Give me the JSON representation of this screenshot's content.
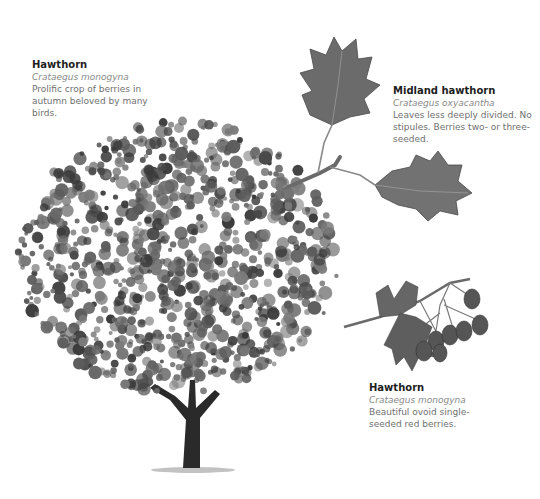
{
  "captions": {
    "tree": {
      "title": "Hawthorn",
      "latin": "Crataegus monogyna",
      "description": "Prolific crop of berries in autumn beloved by many birds."
    },
    "midland": {
      "title": "Midland hawthorn",
      "latin": "Crataegus oxyacantha",
      "description": "Leaves less deeply divided. No stipules. Berries two- or three-seeded."
    },
    "berries": {
      "title": "Hawthorn",
      "latin": "Crataegus monogyna",
      "description": "Beautiful ovoid single-seeded red berries."
    }
  },
  "illustrations": {
    "tree": "hawthorn-tree-illustration",
    "leaves": "midland-hawthorn-leaves-illustration",
    "berries": "hawthorn-berries-illustration"
  },
  "colors": {
    "foliage_dark": "#3a3a3a",
    "foliage_mid": "#5c5c5c",
    "foliage_light": "#7a7a7a",
    "trunk": "#2a2a2a",
    "leaf": "#6b6b6b",
    "berry": "#555555",
    "title_text": "#1e1e1e",
    "body_text": "#707070"
  }
}
